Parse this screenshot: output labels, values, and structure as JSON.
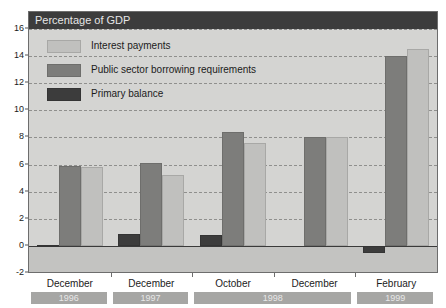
{
  "chart_data": {
    "type": "bar",
    "title": "Percentage of GDP",
    "xlabel": "",
    "ylabel": "",
    "ylim": [
      -2,
      16
    ],
    "ytick_step": 2,
    "yticks": [
      "16",
      "14",
      "12",
      "10",
      "8",
      "6",
      "4",
      "2",
      "0",
      "-2"
    ],
    "ytick_values": [
      16,
      14,
      12,
      10,
      8,
      6,
      4,
      2,
      0,
      -2
    ],
    "grid": true,
    "grid_style": "dashed-horizontal",
    "legend_position": "inside-top-left",
    "categories": [
      "December",
      "December",
      "October",
      "December",
      "February"
    ],
    "category_years": [
      "1996",
      "1997",
      "1998",
      "1998",
      "1999"
    ],
    "series": [
      {
        "name": "Interest payments",
        "color": "#c0c0be",
        "values": [
          5.8,
          5.2,
          7.6,
          8.0,
          14.5
        ]
      },
      {
        "name": "Public sector borrowing requirements",
        "color": "#7d7d7b",
        "values": [
          5.9,
          6.1,
          8.4,
          8.0,
          14.0
        ]
      },
      {
        "name": "Primary balance",
        "color": "#3c3c3c",
        "values": [
          0.1,
          0.9,
          0.8,
          0.0,
          -0.5
        ]
      }
    ],
    "series_draw_order": [
      "Primary balance",
      "Public sector borrowing requirements",
      "Interest payments"
    ],
    "year_bands": [
      {
        "label": "1996",
        "span": 1
      },
      {
        "label": "1997",
        "span": 1
      },
      {
        "label": "1998",
        "span": 2
      },
      {
        "label": "1999",
        "span": 1
      }
    ]
  },
  "colors": {
    "title_bar": "#3c3c3c",
    "title_text": "#e6e6e6",
    "plot_background": "#d4d4d2",
    "negative_zone": "#c3c3c1",
    "gridline": "#8f8f8d",
    "axis_text": "#1b1b1b",
    "year_band": "#a6a6a4",
    "year_band_text": "#e8e8e8"
  }
}
